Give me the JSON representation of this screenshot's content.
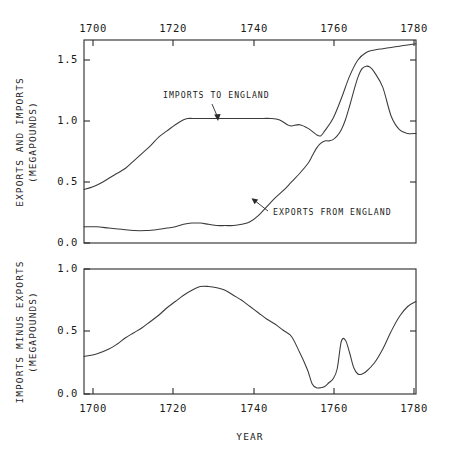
{
  "chart_data": [
    {
      "type": "line",
      "panel": "top",
      "title": "",
      "xlabel": "",
      "ylabel": "EXPORTS AND IMPORTS (MEGAPOUNDS)",
      "ylabel_lines": [
        "EXPORTS AND IMPORTS",
        "(MEGAPOUNDS)"
      ],
      "xlim": [
        1700,
        1780
      ],
      "ylim": [
        0.0,
        1.63
      ],
      "xticks": [
        1700,
        1720,
        1740,
        1760,
        1780
      ],
      "xticklabels": [
        "1700",
        "1720",
        "1740",
        "1760",
        "1780"
      ],
      "xtick_position": "top",
      "yticks": [
        0.0,
        0.5,
        1.0,
        1.5
      ],
      "yticklabels": [
        "0.0",
        "0.5",
        "1.0",
        "1.5"
      ],
      "grid": false,
      "legend": "annotations",
      "annotations": [
        {
          "text": "IMPORTS TO ENGLAND",
          "series": "Imports to England",
          "x": 1728,
          "y": 1.18
        },
        {
          "text": "EXPORTS FROM ENGLAND",
          "series": "Exports from England",
          "x": 1758,
          "y": 0.28
        }
      ],
      "series": [
        {
          "name": "Imports to England",
          "x": [
            1700,
            1702,
            1704,
            1706,
            1708,
            1710,
            1712,
            1714,
            1716,
            1718,
            1720,
            1722,
            1724,
            1725,
            1727,
            1730,
            1734,
            1738,
            1742,
            1745,
            1747,
            1749,
            1750,
            1752,
            1754,
            1756,
            1757,
            1758,
            1760,
            1762,
            1764,
            1766,
            1768,
            1770,
            1772,
            1774,
            1776,
            1778,
            1780
          ],
          "y": [
            0.43,
            0.45,
            0.48,
            0.52,
            0.56,
            0.6,
            0.66,
            0.72,
            0.78,
            0.85,
            0.9,
            0.95,
            0.99,
            1.0,
            1.0,
            1.0,
            1.0,
            1.0,
            1.0,
            1.0,
            0.99,
            0.95,
            0.94,
            0.95,
            0.92,
            0.87,
            0.86,
            0.9,
            1.0,
            1.16,
            1.34,
            1.47,
            1.53,
            1.55,
            1.56,
            1.57,
            1.58,
            1.59,
            1.6
          ]
        },
        {
          "name": "Exports from England",
          "x": [
            1700,
            1703,
            1706,
            1709,
            1712,
            1715,
            1718,
            1720,
            1722,
            1724,
            1726,
            1728,
            1730,
            1732,
            1734,
            1736,
            1738,
            1740,
            1742,
            1744,
            1746,
            1748,
            1750,
            1752,
            1754,
            1755,
            1756,
            1757,
            1758,
            1759,
            1760,
            1761,
            1762,
            1763,
            1764,
            1765,
            1766,
            1767,
            1768,
            1769,
            1770,
            1772,
            1774,
            1776,
            1778,
            1780
          ],
          "y": [
            0.13,
            0.13,
            0.12,
            0.11,
            0.1,
            0.1,
            0.11,
            0.12,
            0.13,
            0.15,
            0.16,
            0.16,
            0.15,
            0.14,
            0.14,
            0.14,
            0.15,
            0.17,
            0.22,
            0.29,
            0.36,
            0.42,
            0.49,
            0.56,
            0.64,
            0.7,
            0.76,
            0.8,
            0.82,
            0.82,
            0.83,
            0.86,
            0.91,
            0.99,
            1.1,
            1.22,
            1.33,
            1.4,
            1.42,
            1.41,
            1.37,
            1.25,
            1.02,
            0.91,
            0.88,
            0.88
          ]
        }
      ]
    },
    {
      "type": "line",
      "panel": "bottom",
      "title": "",
      "xlabel": "YEAR",
      "ylabel": "IMPORTS MINUS EXPORTS (MEGAPOUNDS)",
      "ylabel_lines": [
        "IMPORTS MINUS EXPORTS",
        "(MEGAPOUNDS)"
      ],
      "xlim": [
        1700,
        1780
      ],
      "ylim": [
        0.0,
        1.0
      ],
      "xticks": [
        1700,
        1720,
        1740,
        1760,
        1780
      ],
      "xticklabels": [
        "1700",
        "1720",
        "1740",
        "1760",
        "1780"
      ],
      "xtick_position": "bottom",
      "yticks": [
        0.0,
        0.5,
        1.0
      ],
      "yticklabels": [
        "0.0",
        "0.5",
        "1.0"
      ],
      "grid": false,
      "series": [
        {
          "name": "Imports minus exports",
          "x": [
            1700,
            1703,
            1706,
            1708,
            1710,
            1712,
            1714,
            1716,
            1718,
            1720,
            1722,
            1724,
            1726,
            1728,
            1730,
            1732,
            1734,
            1736,
            1738,
            1740,
            1742,
            1744,
            1746,
            1748,
            1750,
            1752,
            1753,
            1754,
            1755,
            1756,
            1757,
            1758,
            1759,
            1760,
            1761,
            1762,
            1763,
            1764,
            1765,
            1766,
            1767,
            1768,
            1770,
            1772,
            1774,
            1776,
            1778,
            1780
          ],
          "y": [
            0.3,
            0.32,
            0.36,
            0.4,
            0.45,
            0.49,
            0.53,
            0.58,
            0.63,
            0.69,
            0.74,
            0.79,
            0.83,
            0.86,
            0.86,
            0.85,
            0.83,
            0.79,
            0.75,
            0.7,
            0.65,
            0.6,
            0.56,
            0.51,
            0.46,
            0.33,
            0.26,
            0.18,
            0.08,
            0.05,
            0.05,
            0.06,
            0.09,
            0.12,
            0.2,
            0.42,
            0.43,
            0.33,
            0.21,
            0.16,
            0.16,
            0.18,
            0.25,
            0.36,
            0.5,
            0.62,
            0.7,
            0.74
          ]
        }
      ]
    }
  ],
  "top_panel": {
    "ylabel_line1": "EXPORTS AND IMPORTS",
    "ylabel_line2": "(MEGAPOUNDS)",
    "ytick_0": "0.0",
    "ytick_1": "0.5",
    "ytick_2": "1.0",
    "ytick_3": "1.5",
    "xtick_0": "1700",
    "xtick_1": "1720",
    "xtick_2": "1740",
    "xtick_3": "1760",
    "xtick_4": "1780",
    "annot_imports": "IMPORTS TO ENGLAND",
    "annot_exports": "EXPORTS FROM ENGLAND"
  },
  "bottom_panel": {
    "ylabel_line1": "IMPORTS MINUS EXPORTS",
    "ylabel_line2": "(MEGAPOUNDS)",
    "ytick_0": "0.0",
    "ytick_1": "0.5",
    "ytick_2": "1.0",
    "xtick_0": "1700",
    "xtick_1": "1720",
    "xtick_2": "1740",
    "xtick_3": "1760",
    "xtick_4": "1780",
    "xaxis_title": "YEAR"
  },
  "colors": {
    "background": "#ffffff",
    "axis": "#2b2b2b",
    "curve": "#3a3a3a",
    "text": "#1a1a1a"
  }
}
